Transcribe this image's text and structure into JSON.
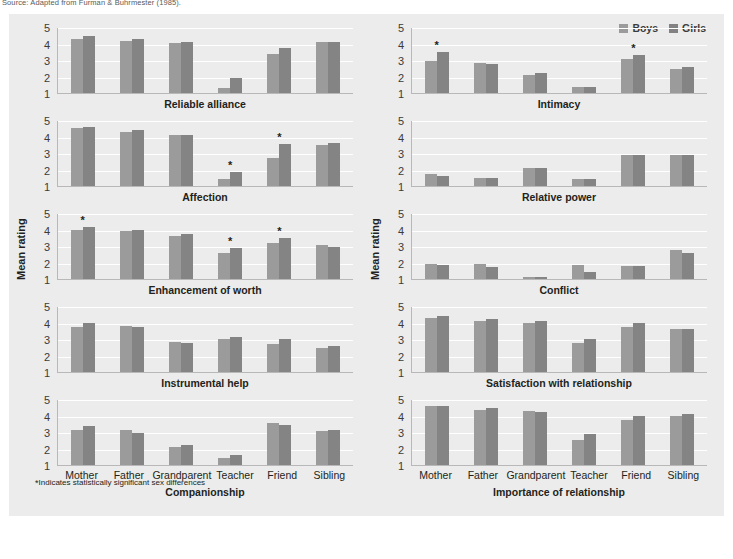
{
  "source_note": "Source: Adapted from Furman & Buhrmester (1985).",
  "legend": {
    "boys_label": "Boys",
    "girls_label": "Girls",
    "boys_color": "#9b9b9b",
    "girls_color": "#848484"
  },
  "y_axis_label": "Mean rating",
  "y_ticks": [
    "5",
    "4",
    "3",
    "2",
    "1"
  ],
  "footnote": "Indicates statistically significant sex differences",
  "footnote_marker": "*",
  "categories": [
    "Mother",
    "Father",
    "Grandparent",
    "Teacher",
    "Friend",
    "Sibling"
  ],
  "chart_data": {
    "type": "bar",
    "xlabel": "",
    "ylabel": "Mean rating",
    "ylim": [
      1,
      5
    ],
    "grid": true,
    "legend_position": "top-right",
    "categories": [
      "Mother",
      "Father",
      "Grandparent",
      "Teacher",
      "Friend",
      "Sibling"
    ],
    "annotation_note": "* Indicates statistically significant sex differences",
    "panels": [
      {
        "title": "Reliable alliance",
        "column": "left",
        "row": 1,
        "series": [
          {
            "name": "Boys",
            "values": [
              4.3,
              4.15,
              4.05,
              1.3,
              3.35,
              4.1
            ]
          },
          {
            "name": "Girls",
            "values": [
              4.45,
              4.3,
              4.1,
              1.9,
              3.7,
              4.1
            ]
          }
        ],
        "significant": []
      },
      {
        "title": "Intimacy",
        "column": "right",
        "row": 1,
        "series": [
          {
            "name": "Boys",
            "values": [
              2.95,
              2.8,
              2.1,
              1.35,
              3.05,
              2.45
            ]
          },
          {
            "name": "Girls",
            "values": [
              3.5,
              2.75,
              2.2,
              1.35,
              3.3,
              2.55
            ]
          }
        ],
        "significant": [
          "Mother",
          "Friend"
        ]
      },
      {
        "title": "Affection",
        "column": "left",
        "row": 2,
        "series": [
          {
            "name": "Boys",
            "values": [
              4.5,
              4.3,
              4.1,
              1.4,
              2.7,
              3.5
            ]
          },
          {
            "name": "Girls",
            "values": [
              4.6,
              4.4,
              4.1,
              1.85,
              3.55,
              3.6
            ]
          }
        ],
        "significant": [
          "Teacher",
          "Friend"
        ]
      },
      {
        "title": "Relative power",
        "column": "right",
        "row": 2,
        "series": [
          {
            "name": "Boys",
            "values": [
              1.7,
              1.5,
              2.1,
              1.45,
              2.9,
              2.9
            ]
          },
          {
            "name": "Girls",
            "values": [
              1.6,
              1.5,
              2.1,
              1.45,
              2.85,
              2.85
            ]
          }
        ],
        "significant": []
      },
      {
        "title": "Enhancement of worth",
        "column": "left",
        "row": 3,
        "series": [
          {
            "name": "Boys",
            "values": [
              3.95,
              3.9,
              3.6,
              2.55,
              3.2,
              3.05
            ]
          },
          {
            "name": "Girls",
            "values": [
              4.15,
              4.0,
              3.7,
              2.85,
              3.5,
              2.95
            ]
          }
        ],
        "significant": [
          "Mother",
          "Teacher",
          "Friend"
        ]
      },
      {
        "title": "Conflict",
        "column": "right",
        "row": 3,
        "series": [
          {
            "name": "Boys",
            "values": [
              1.9,
              1.9,
              1.15,
              1.85,
              1.8,
              2.75
            ]
          },
          {
            "name": "Girls",
            "values": [
              1.85,
              1.75,
              1.1,
              1.45,
              1.8,
              2.55
            ]
          }
        ],
        "significant": []
      },
      {
        "title": "Instrumental help",
        "column": "left",
        "row": 4,
        "series": [
          {
            "name": "Boys",
            "values": [
              3.7,
              3.8,
              2.8,
              3.0,
              2.7,
              2.45
            ]
          },
          {
            "name": "Girls",
            "values": [
              3.95,
              3.75,
              2.75,
              3.15,
              3.0,
              2.55
            ]
          }
        ],
        "significant": []
      },
      {
        "title": "Satisfaction with relationship",
        "column": "right",
        "row": 4,
        "series": [
          {
            "name": "Boys",
            "values": [
              4.3,
              4.1,
              3.95,
              2.75,
              3.7,
              3.6
            ]
          },
          {
            "name": "Girls",
            "values": [
              4.4,
              4.2,
              4.1,
              3.0,
              3.95,
              3.6
            ]
          }
        ],
        "significant": []
      },
      {
        "title": "Companionship",
        "column": "left",
        "row": 5,
        "series": [
          {
            "name": "Boys",
            "values": [
              3.15,
              3.1,
              2.1,
              1.45,
              3.55,
              3.05
            ]
          },
          {
            "name": "Girls",
            "values": [
              3.35,
              2.95,
              2.2,
              1.6,
              3.45,
              3.1
            ]
          }
        ],
        "significant": []
      },
      {
        "title": "Importance of relationship",
        "column": "right",
        "row": 5,
        "series": [
          {
            "name": "Boys",
            "values": [
              4.55,
              4.35,
              4.25,
              2.5,
              3.75,
              3.95
            ]
          },
          {
            "name": "Girls",
            "values": [
              4.6,
              4.45,
              4.2,
              2.9,
              3.95,
              4.1
            ]
          }
        ],
        "significant": []
      }
    ]
  }
}
